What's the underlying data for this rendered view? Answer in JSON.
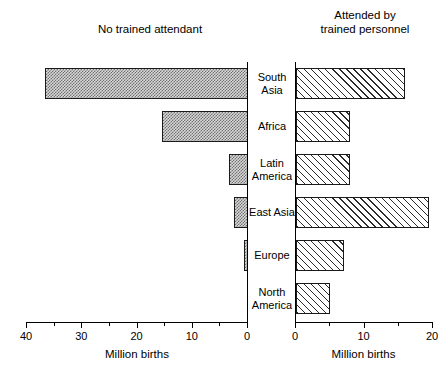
{
  "titles": {
    "left": "No trained attendant",
    "right": "Attended by\ntrained personnel"
  },
  "axis": {
    "left": {
      "caption": "Million births",
      "ticks": [
        "40",
        "30",
        "20",
        "10",
        "0"
      ],
      "min": 0,
      "max": 40,
      "reversed": true
    },
    "right": {
      "caption": "Million births",
      "ticks": [
        "0",
        "10",
        "20"
      ],
      "min": 0,
      "max": 20,
      "reversed": false
    }
  },
  "categories": [
    "South\nAsia",
    "Africa",
    "Latin\nAmerica",
    "East Asia",
    "Europe",
    "North\nAmerica"
  ],
  "chart_data": {
    "type": "bar",
    "orientation": "horizontal",
    "layout": "back-to-back bidirectional",
    "categories": [
      "South Asia",
      "Africa",
      "Latin America",
      "East Asia",
      "Europe",
      "North America"
    ],
    "series": [
      {
        "name": "No trained attendant",
        "side": "left",
        "fill": "stipple",
        "xlabel": "Million births",
        "xlim": [
          40,
          0
        ],
        "values": [
          36.5,
          15.5,
          3.5,
          2.5,
          0.7,
          0.0
        ]
      },
      {
        "name": "Attended by trained personnel",
        "side": "right",
        "fill": "diagonal-hatch",
        "xlabel": "Million births",
        "xlim": [
          0,
          20
        ],
        "values": [
          16.0,
          8.0,
          8.0,
          19.5,
          7.0,
          5.0
        ]
      }
    ],
    "ylabel": "",
    "grid": false,
    "legend": "panel titles"
  },
  "colors": {
    "axis": "#000000",
    "bar_outline": "#1a1a1a",
    "stipple_fill": "#d8d8d8",
    "stipple_dot": "#6f6f6f",
    "hatch_line": "#2b2b2b",
    "background": "#ffffff"
  }
}
